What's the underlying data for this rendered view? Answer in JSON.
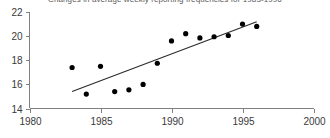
{
  "chart_data": {
    "type": "scatter",
    "title": "Changes in average weekly reporting frequencies for 1983-1996",
    "xlabel": "",
    "ylabel": "",
    "xlim": [
      1980,
      2000
    ],
    "ylim": [
      14,
      22
    ],
    "xticks": [
      1980,
      1985,
      1990,
      1995,
      2000
    ],
    "yticks": [
      14,
      16,
      18,
      20,
      22
    ],
    "grid": false,
    "legend": false,
    "x": [
      1983,
      1984,
      1985,
      1986,
      1987,
      1988,
      1989,
      1990,
      1991,
      1992,
      1993,
      1994,
      1995,
      1996
    ],
    "values": [
      17.4,
      15.2,
      17.5,
      15.4,
      15.55,
      16.0,
      17.75,
      19.6,
      20.2,
      19.85,
      19.95,
      20.05,
      21.0,
      20.8
    ],
    "series": [
      {
        "name": "observations",
        "marker": "filled-circle",
        "color": "#000000",
        "x": [
          1983,
          1984,
          1985,
          1986,
          1987,
          1988,
          1989,
          1990,
          1991,
          1992,
          1993,
          1994,
          1995,
          1996
        ],
        "values": [
          17.4,
          15.2,
          17.5,
          15.4,
          15.55,
          16.0,
          17.75,
          19.6,
          20.2,
          19.85,
          19.95,
          20.05,
          21.0,
          20.8
        ]
      },
      {
        "name": "trend-line",
        "marker": "none",
        "color": "#2b2b2b",
        "x": [
          1983,
          1996
        ],
        "values": [
          15.4,
          21.2
        ]
      }
    ]
  },
  "colors": {
    "axis": "#808080",
    "marker": "#000000",
    "trend": "#2b2b2b",
    "title": "#5a5a5a",
    "tick_text": "#3a3a3a",
    "background": "#ffffff"
  }
}
